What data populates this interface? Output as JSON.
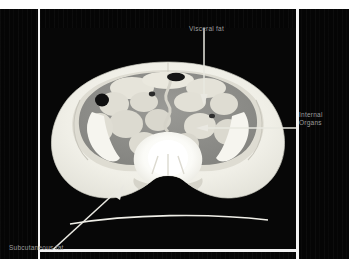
{
  "slide": {
    "kind": "presentation-slide",
    "background_color": "#050505",
    "page_color": "#ffffff",
    "frame_border_color": "#f2f2f2"
  },
  "image": {
    "modality": "CT",
    "view": "axial abdominal / pelvic cross-section",
    "background_color": "#070707",
    "tissue_colors": {
      "subcutaneous_fat": "#f2f1ea",
      "visceral_fat": "#8d8d8d",
      "muscle": "#d8d7cf",
      "bone": "#ffffff",
      "bowel_gas": "#141414",
      "table_line": "#f0efe8"
    }
  },
  "annotations": [
    {
      "id": "visceral-fat",
      "label": "Visceral fat",
      "text_color": "#9d9d9d",
      "arrow": "vertical-down"
    },
    {
      "id": "internal-organs",
      "label_line1": "Internal",
      "label_line2": "Organs",
      "text_color": "#9d9d9d",
      "arrow": "horizontal-left"
    },
    {
      "id": "subcutaneous-fat",
      "label": "Subcutaneous fat",
      "text_color": "#9d9d9d",
      "arrow": "diagonal-up-right"
    }
  ]
}
